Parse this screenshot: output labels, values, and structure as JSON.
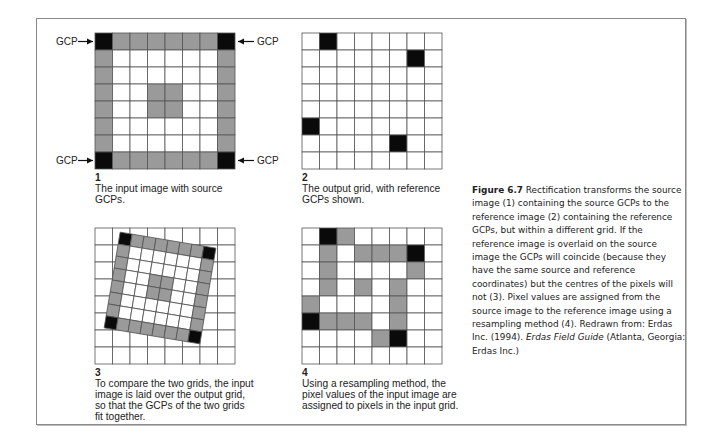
{
  "figure": {
    "label": "Figure 6.7",
    "caption_part1": " Rectification transforms the source image (1) containing the source GCPs to the reference image (2) containing the reference GCPs, but within a different grid. If the reference image is overlaid on the source image the GCPs will coincide (because they have the same source and reference coordinates) but the centres of the pixels will not (3). Pixel values are assigned from the source image to the reference image using a resampling method (4). Redrawn from: Erdas Inc. (1994). ",
    "caption_italic": "Erdas Field Guide",
    "caption_part2": " (Atlanta, Georgia: Erdas Inc.)"
  },
  "colors": {
    "black": "#0a0a0a",
    "gray": "#9a9a9a",
    "white": "#ffffff",
    "grid_line": "#555555"
  },
  "gcp_label": "GCP",
  "panels": [
    {
      "number": "1",
      "caption": "The input image with source GCPs.",
      "rows": 8,
      "cols": 8,
      "cells": [
        "BGGGGGGB",
        "GWWWWWWG",
        "GWWWWWWG",
        "GWWGGWWG",
        "GWWGGWWG",
        "GWWWWWWG",
        "GWWWWWWG",
        "BGGGGGGB"
      ]
    },
    {
      "number": "2",
      "caption": "The output grid, with reference GCPs shown.",
      "rows": 8,
      "cols": 8,
      "cells": [
        "WBWWWWWW",
        "WWWWWWBW",
        "WWWWWWWW",
        "WWWWWWWW",
        "WWWWWWWW",
        "BWWWWWWW",
        "WWWWWBWW",
        "WWWWWWWW"
      ]
    },
    {
      "number": "3",
      "caption": "To compare the two grids, the input image is laid over the output grid, so that the GCPs of the two grids fit together.",
      "rows": 8,
      "cols": 8,
      "overlay_rotation_deg": 9.5
    },
    {
      "number": "4",
      "caption": "Using a resampling method, the pixel values of the input image are assigned to pixels in the input grid.",
      "rows": 8,
      "cols": 8,
      "cells": [
        "WBGWWWWW",
        "WGWGGGBW",
        "WGWWWWGW",
        "WGWGWGWW",
        "GWWWWGWW",
        "BGGGWGWW",
        "WWWWGBWW",
        "WWWWWWWW"
      ]
    }
  ]
}
